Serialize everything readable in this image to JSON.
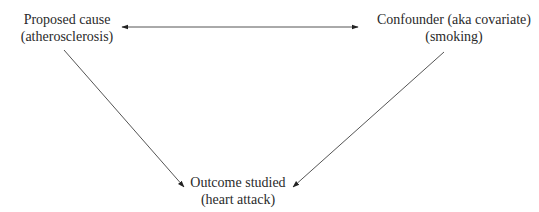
{
  "diagram": {
    "type": "causal-confounding-triangle",
    "nodes": [
      {
        "id": "cause",
        "line1": "Proposed cause",
        "line2": "(atherosclerosis)"
      },
      {
        "id": "confounder",
        "line1": "Confounder (aka covariate)",
        "line2": "(smoking)"
      },
      {
        "id": "outcome",
        "line1": "Outcome studied",
        "line2": "(heart attack)"
      }
    ],
    "edges": [
      {
        "from": "cause",
        "to": "confounder",
        "style": "bidirectional-arrow"
      },
      {
        "from": "cause",
        "to": "outcome",
        "style": "arrow"
      },
      {
        "from": "confounder",
        "to": "outcome",
        "style": "arrow"
      }
    ],
    "colors": {
      "line": "#555555",
      "text": "#2a2a2a",
      "background": "#ffffff"
    }
  }
}
